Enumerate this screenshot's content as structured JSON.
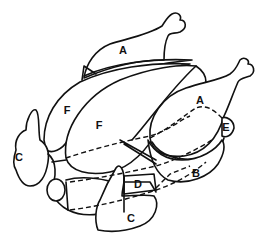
{
  "diagram": {
    "labels": [
      {
        "id": "A-top",
        "text": "A",
        "x": 123,
        "y": 50
      },
      {
        "id": "A-right",
        "text": "A",
        "x": 200,
        "y": 100
      },
      {
        "id": "F-left",
        "text": "F",
        "x": 67,
        "y": 110
      },
      {
        "id": "F-center",
        "text": "F",
        "x": 99,
        "y": 125
      },
      {
        "id": "E",
        "text": "E",
        "x": 226,
        "y": 127
      },
      {
        "id": "C-left",
        "text": "C",
        "x": 19,
        "y": 157
      },
      {
        "id": "B",
        "text": "B",
        "x": 196,
        "y": 173
      },
      {
        "id": "D",
        "text": "D",
        "x": 138,
        "y": 184
      },
      {
        "id": "C-bottom",
        "text": "C",
        "x": 131,
        "y": 218
      }
    ],
    "colors": {
      "line": "#111111",
      "background": "#ffffff"
    }
  }
}
